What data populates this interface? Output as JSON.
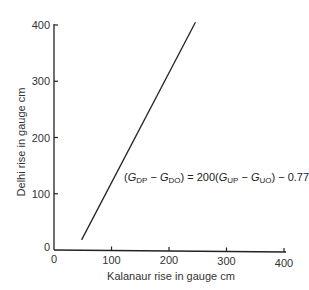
{
  "chart_data": {
    "type": "line",
    "title": "",
    "xlabel": "Kalanaur rise in gauge cm",
    "ylabel": "Delhi rise in gauge cm",
    "xlim": [
      0,
      400
    ],
    "ylim": [
      0,
      400
    ],
    "x_ticks": [
      "0",
      "100",
      "200",
      "300",
      "400"
    ],
    "y_ticks": [
      "0",
      "100",
      "200",
      "300",
      "400"
    ],
    "grid": false,
    "legend": null,
    "series": [
      {
        "name": "Delhi vs Kalanaur gauge rise",
        "x": [
          48,
          246
        ],
        "y": [
          18,
          405
        ]
      }
    ],
    "annotations": [
      {
        "text": "(G_DP − G_DO) = 200(G_UP − G_UO) − 0.77",
        "position": [
          120,
          125
        ]
      }
    ]
  },
  "equation": {
    "open": "(",
    "g1": "G",
    "s1": "DP",
    "minus1": " − ",
    "g2": "G",
    "s2": "DO",
    "mid": ") = 200(",
    "g3": "G",
    "s3": "UP",
    "minus2": " − ",
    "g4": "G",
    "s4": "UO",
    "tail": ") − 0.77"
  }
}
